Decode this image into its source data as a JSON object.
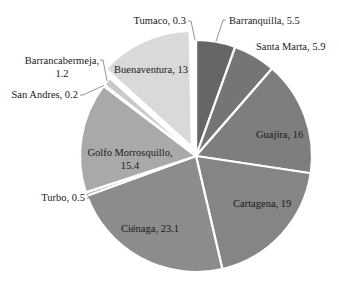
{
  "chart_data": {
    "type": "pie",
    "title": "",
    "start_angle_deg": 0,
    "direction": "clockwise",
    "center": [
      196,
      156
    ],
    "radius": 116,
    "categories": [
      "Barranquilla",
      "Santa Marta",
      "Guajira",
      "Cartagena",
      "Ciénaga",
      "Turbo",
      "Golfo Morrosquillo",
      "San Andres",
      "Barrancabermeja",
      "Buenaventura",
      "Tumaco"
    ],
    "values": [
      5.5,
      5.9,
      16,
      19,
      23.1,
      0.5,
      15.4,
      0.2,
      1.2,
      13,
      0.3
    ],
    "colors": [
      "#666666",
      "#757575",
      "#7e7e7e",
      "#858585",
      "#8c8c8c",
      "#b0b0b0",
      "#a9a9a9",
      "#c4c4c4",
      "#c9c9c9",
      "#d9d9d9",
      "#cfcfcf"
    ],
    "exploded": [
      "Buenaventura"
    ],
    "labels": [
      {
        "name": "Barranquilla",
        "text": "Barranquilla, 5.5",
        "x": 229,
        "y": 24,
        "anchor": "start",
        "leader": true
      },
      {
        "name": "Santa Marta",
        "text": "Santa Marta, 5.9",
        "x": 256,
        "y": 50,
        "anchor": "start",
        "leader": false
      },
      {
        "name": "Guajira",
        "text": "Guajira, 16",
        "x": 256,
        "y": 138,
        "anchor": "start",
        "leader": false
      },
      {
        "name": "Cartagena",
        "text": "Cartagena, 19",
        "x": 233,
        "y": 207,
        "anchor": "start",
        "leader": false
      },
      {
        "name": "Ciénaga",
        "text": "Ciénaga, 23.1",
        "x": 121,
        "y": 232,
        "anchor": "start",
        "leader": false
      },
      {
        "name": "Turbo",
        "text": "Turbo, 0.5",
        "x": 85,
        "y": 201,
        "anchor": "end",
        "leader": true
      },
      {
        "name": "Golfo Morrosquillo",
        "lines": [
          "Golfo Morrosquillo,",
          "15.4"
        ],
        "x": 130,
        "y": 156,
        "anchor": "middle",
        "leader": false
      },
      {
        "name": "San Andres",
        "text": "San Andres, 0.2",
        "x": 78,
        "y": 98,
        "anchor": "end",
        "leader": true
      },
      {
        "name": "Barrancabermeja",
        "lines": [
          "Barrancabermeja,",
          "1.2"
        ],
        "x": 62,
        "y": 64,
        "anchor": "middle",
        "leader": true
      },
      {
        "name": "Buenaventura",
        "text": "Buenaventura, 13",
        "x": 151,
        "y": 73,
        "anchor": "middle",
        "leader": false
      },
      {
        "name": "Tumaco",
        "text": "Tumaco, 0.3",
        "x": 186,
        "y": 24,
        "anchor": "end",
        "leader": true
      }
    ],
    "legend": null,
    "grid": false
  }
}
